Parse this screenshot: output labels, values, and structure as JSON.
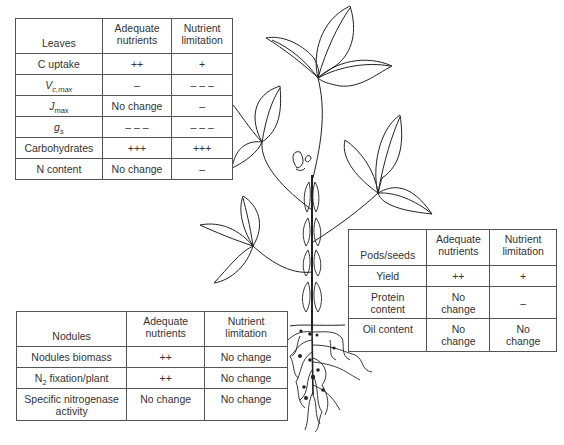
{
  "leaves_table": {
    "header": [
      "Leaves",
      "Adequate nutrients",
      "Nutrient limitation"
    ],
    "rows": [
      {
        "parameter": "C uptake",
        "adequate": "++",
        "limitation": "+"
      },
      {
        "parameter_main": "V",
        "parameter_sub": "c,max",
        "adequate": "–",
        "limitation": "– – –"
      },
      {
        "parameter_main": "J",
        "parameter_sub": "max",
        "adequate": "No change",
        "limitation": "–"
      },
      {
        "parameter_main": "g",
        "parameter_sub": "s",
        "adequate": "– – –",
        "limitation": "– – –"
      },
      {
        "parameter": "Carbohydrates",
        "adequate": "+++",
        "limitation": "+++"
      },
      {
        "parameter": "N content",
        "adequate": "No change",
        "limitation": "–"
      }
    ]
  },
  "pods_table": {
    "header": [
      "Pods/seeds",
      "Adequate nutrients",
      "Nutrient limitation"
    ],
    "rows": [
      {
        "parameter": "Yield",
        "adequate": "++",
        "limitation": "+"
      },
      {
        "parameter": "Protein content",
        "adequate": "No change",
        "limitation": "–"
      },
      {
        "parameter": "Oil content",
        "adequate": "No change",
        "limitation": "No change"
      }
    ]
  },
  "nodules_table": {
    "header": [
      "Nodules",
      "Adequate nutrients",
      "Nutrient limitation"
    ],
    "rows": [
      {
        "parameter": "Nodules biomass",
        "adequate": "++",
        "limitation": "No change"
      },
      {
        "parameter_main": "N",
        "parameter_sub": "2",
        "parameter_rest": " fixation/plant",
        "adequate": "++",
        "limitation": "No change"
      },
      {
        "parameter": "Specific nitrogenase activity",
        "adequate": "No change",
        "limitation": "No change"
      }
    ]
  },
  "illustration": {
    "subject": "soybean-plant",
    "line_color": "#222222"
  }
}
